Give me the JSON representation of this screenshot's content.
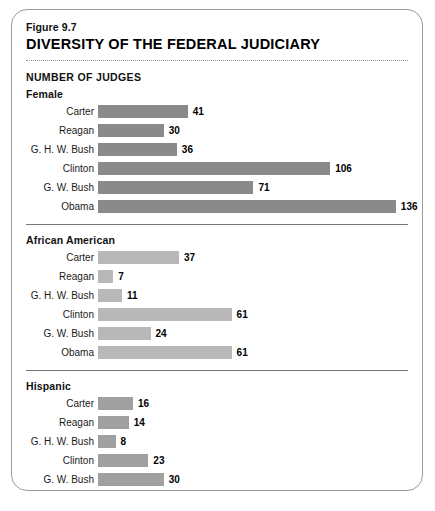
{
  "figure": {
    "number": "Figure 9.7",
    "title": "DIVERSITY OF THE FEDERAL JUDICIARY",
    "units_label": "NUMBER OF JUDGES"
  },
  "chart_data": {
    "type": "bar",
    "title": "DIVERSITY OF THE FEDERAL JUDICIARY",
    "subtitle": "Figure 9.7",
    "orientation": "horizontal",
    "xlabel": "NUMBER OF JUDGES",
    "ylabel": "",
    "grid": false,
    "legend": "none",
    "xlim": [
      0,
      140
    ],
    "categories": [
      "Carter",
      "Reagan",
      "G. H. W. Bush",
      "Clinton",
      "G. W. Bush",
      "Obama"
    ],
    "panels": [
      {
        "name": "Female",
        "color": "#8a8a8a",
        "categories": [
          "Carter",
          "Reagan",
          "G. H. W. Bush",
          "Clinton",
          "G. W. Bush",
          "Obama"
        ],
        "values": [
          41,
          30,
          36,
          106,
          71,
          136
        ],
        "bars": [
          {
            "label": "Carter",
            "value": 41,
            "value_text": "41"
          },
          {
            "label": "Reagan",
            "value": 30,
            "value_text": "30"
          },
          {
            "label": "G. H. W. Bush",
            "value": 36,
            "value_text": "36"
          },
          {
            "label": "Clinton",
            "value": 106,
            "value_text": "106"
          },
          {
            "label": "G. W. Bush",
            "value": 71,
            "value_text": "71"
          },
          {
            "label": "Obama",
            "value": 136,
            "value_text": "136"
          }
        ]
      },
      {
        "name": "African American",
        "color": "#b8b8b8",
        "categories": [
          "Carter",
          "Reagan",
          "G. H. W. Bush",
          "Clinton",
          "G. W. Bush",
          "Obama"
        ],
        "values": [
          37,
          7,
          11,
          61,
          24,
          61
        ],
        "bars": [
          {
            "label": "Carter",
            "value": 37,
            "value_text": "37"
          },
          {
            "label": "Reagan",
            "value": 7,
            "value_text": "7"
          },
          {
            "label": "G. H. W. Bush",
            "value": 11,
            "value_text": "11"
          },
          {
            "label": "Clinton",
            "value": 61,
            "value_text": "61"
          },
          {
            "label": "G. W. Bush",
            "value": 24,
            "value_text": "24"
          },
          {
            "label": "Obama",
            "value": 61,
            "value_text": "61"
          }
        ]
      },
      {
        "name": "Hispanic",
        "color": "#a0a0a0",
        "categories": [
          "Carter",
          "Reagan",
          "G. H. W. Bush",
          "Clinton",
          "G. W. Bush",
          "Obama"
        ],
        "values": [
          16,
          14,
          8,
          23,
          30,
          36
        ],
        "bars": [
          {
            "label": "Carter",
            "value": 16,
            "value_text": "16"
          },
          {
            "label": "Reagan",
            "value": 14,
            "value_text": "14"
          },
          {
            "label": "G. H. W. Bush",
            "value": 8,
            "value_text": "8"
          },
          {
            "label": "Clinton",
            "value": 23,
            "value_text": "23"
          },
          {
            "label": "G. W. Bush",
            "value": 30,
            "value_text": "30"
          },
          {
            "label": "Obama",
            "value": 36,
            "value_text": "36"
          }
        ]
      }
    ]
  },
  "scale": {
    "px_per_unit": 2.19
  }
}
